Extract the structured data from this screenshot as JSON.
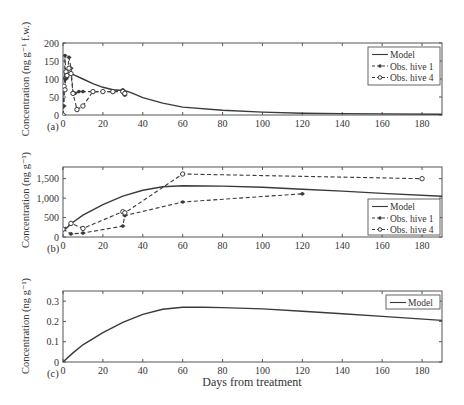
{
  "figure": {
    "xlabel": "Days from treatment",
    "x_ticks": [
      0,
      20,
      40,
      60,
      80,
      100,
      120,
      140,
      160,
      180
    ],
    "x_range": [
      0,
      190
    ]
  },
  "chart_data": [
    {
      "panel": "(a)",
      "type": "line",
      "title": "",
      "xlabel": "",
      "ylabel": "Concentration (ng g⁻¹ f.w.)",
      "ylim": [
        0,
        200
      ],
      "y_ticks": [
        0,
        50,
        100,
        150,
        200
      ],
      "y_tick_labels": [
        "0",
        "50",
        "100",
        "150",
        "200"
      ],
      "xlim": [
        0,
        190
      ],
      "grid": false,
      "legend_position": "upper right",
      "legend": [
        "Model",
        "Obs. hive 1",
        "Obs. hive 4"
      ],
      "series": [
        {
          "name": "Model",
          "style": "solid",
          "marker": "none",
          "x": [
            0,
            2,
            4,
            6,
            10,
            15,
            20,
            25,
            30,
            32,
            35,
            40,
            50,
            60,
            80,
            100,
            120,
            140,
            160,
            190
          ],
          "y": [
            100,
            118,
            115,
            110,
            100,
            87,
            77,
            70,
            68,
            66,
            60,
            48,
            33,
            22,
            13,
            8,
            5,
            4,
            3,
            2
          ]
        },
        {
          "name": "Obs. hive 1",
          "style": "dashed",
          "marker": "star",
          "x": [
            0,
            0.5,
            1,
            1.5,
            2,
            3,
            4,
            5,
            6,
            8,
            10,
            15,
            20,
            25,
            30,
            30.5,
            31
          ],
          "y": [
            0,
            25,
            165,
            100,
            105,
            160,
            130,
            62,
            60,
            65,
            65,
            65,
            65,
            65,
            70,
            60,
            55
          ]
        },
        {
          "name": "Obs. hive 4",
          "style": "dashed",
          "marker": "circle",
          "x": [
            0,
            0.5,
            1,
            1.5,
            2,
            3,
            4,
            5,
            7,
            10,
            15,
            20,
            25,
            30,
            31
          ],
          "y": [
            0,
            80,
            70,
            120,
            110,
            130,
            115,
            60,
            15,
            25,
            65,
            65,
            65,
            65,
            60
          ]
        }
      ]
    },
    {
      "panel": "(b)",
      "type": "line",
      "title": "",
      "xlabel": "",
      "ylabel": "Concentration (ng g⁻¹)",
      "ylim": [
        0,
        1800
      ],
      "y_ticks": [
        0,
        500,
        1000,
        1500
      ],
      "y_tick_labels": [
        "0",
        "500",
        "1,000",
        "1,500"
      ],
      "xlim": [
        0,
        190
      ],
      "grid": false,
      "legend_position": "lower right",
      "legend": [
        "Model",
        "Obs. hive 1",
        "Obs. hive 4"
      ],
      "series": [
        {
          "name": "Model",
          "style": "solid",
          "marker": "none",
          "x": [
            0,
            5,
            10,
            20,
            30,
            40,
            50,
            60,
            80,
            100,
            120,
            140,
            160,
            190
          ],
          "y": [
            150,
            380,
            560,
            830,
            1050,
            1200,
            1290,
            1320,
            1310,
            1280,
            1230,
            1180,
            1120,
            1050
          ]
        },
        {
          "name": "Obs. hive 1",
          "style": "dashed",
          "marker": "star",
          "x": [
            0,
            4,
            10,
            30,
            31,
            60,
            120
          ],
          "y": [
            200,
            80,
            100,
            280,
            550,
            900,
            1110
          ]
        },
        {
          "name": "Obs. hive 4",
          "style": "dashed",
          "marker": "circle",
          "x": [
            0,
            4,
            10,
            30,
            31,
            60,
            180
          ],
          "y": [
            200,
            350,
            220,
            650,
            620,
            1620,
            1500
          ]
        }
      ]
    },
    {
      "panel": "(c)",
      "type": "line",
      "title": "",
      "xlabel": "Days from treatment",
      "ylabel": "Concentration (ng g⁻¹)",
      "ylim": [
        0,
        0.35
      ],
      "y_ticks": [
        0,
        0.1,
        0.2,
        0.3
      ],
      "y_tick_labels": [
        "0",
        "0.1",
        "0.2",
        "0.3"
      ],
      "xlim": [
        0,
        190
      ],
      "grid": false,
      "legend_position": "upper right",
      "legend": [
        "Model"
      ],
      "series": [
        {
          "name": "Model",
          "style": "solid",
          "marker": "none",
          "x": [
            0,
            5,
            10,
            20,
            30,
            40,
            50,
            60,
            70,
            80,
            100,
            120,
            140,
            160,
            190
          ],
          "y": [
            0,
            0.045,
            0.085,
            0.145,
            0.195,
            0.235,
            0.26,
            0.27,
            0.27,
            0.268,
            0.262,
            0.25,
            0.238,
            0.225,
            0.205
          ]
        }
      ]
    }
  ]
}
